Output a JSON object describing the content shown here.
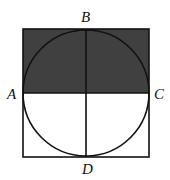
{
  "diagram": {
    "square": {
      "x": 23,
      "y": 29,
      "width": 126,
      "height": 128
    },
    "circle": {
      "cx": 86,
      "cy": 93,
      "r": 63
    },
    "shaded_region": "upper half of square (above line AC)",
    "colors": {
      "shade": "#404040",
      "stroke": "#111111",
      "background": "#ffffff"
    },
    "points": [
      {
        "label": "A",
        "x": 23,
        "y": 93
      },
      {
        "label": "B",
        "x": 86,
        "y": 29
      },
      {
        "label": "C",
        "x": 149,
        "y": 93
      },
      {
        "label": "D",
        "x": 86,
        "y": 157
      }
    ],
    "segments": [
      "AC",
      "BD"
    ]
  },
  "labels": {
    "A": "A",
    "B": "B",
    "C": "C",
    "D": "D"
  }
}
